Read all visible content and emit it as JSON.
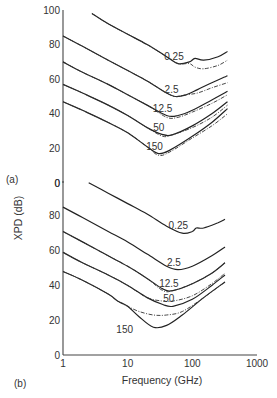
{
  "chart_data": [
    {
      "type": "line",
      "panel_label": "(a)",
      "xscale": "log",
      "xlim": [
        1,
        1000
      ],
      "ylim": [
        0,
        100
      ],
      "yticks": [
        "100",
        "80",
        "60",
        "40",
        "20",
        "0"
      ],
      "ytick_values": [
        100,
        80,
        60,
        40,
        20,
        0
      ],
      "series": [
        {
          "name": "0.25",
          "x": [
            2.8,
            5,
            10,
            20,
            40,
            60,
            90,
            110,
            150,
            250,
            350
          ],
          "y": [
            98,
            92,
            86,
            80,
            73,
            69,
            70,
            72,
            71,
            73,
            76
          ],
          "alt_y": [
            98,
            92,
            86,
            80,
            73,
            69,
            69,
            67,
            66,
            68,
            71
          ]
        },
        {
          "name": "2.5",
          "x": [
            1,
            2,
            5,
            10,
            20,
            40,
            55,
            80,
            120,
            200,
            350
          ],
          "y": [
            85,
            79,
            71,
            65,
            59,
            52,
            50,
            51,
            54,
            58,
            62
          ],
          "alt_y": [
            85,
            79,
            71,
            65,
            59,
            52,
            50,
            51,
            52,
            55,
            58
          ]
        },
        {
          "name": "12.5",
          "x": [
            1,
            2,
            5,
            10,
            20,
            40,
            60,
            100,
            200,
            350
          ],
          "y": [
            70,
            64,
            57,
            51,
            45,
            39,
            39,
            42,
            48,
            53
          ],
          "alt_y": [
            70,
            64,
            57,
            51,
            45,
            38,
            38,
            41,
            46,
            51
          ]
        },
        {
          "name": "50",
          "x": [
            1,
            2,
            5,
            10,
            20,
            35,
            50,
            100,
            200,
            350
          ],
          "y": [
            57,
            52,
            45,
            39,
            32,
            28,
            28,
            33,
            40,
            47
          ],
          "alt_y": [
            57,
            52,
            45,
            39,
            32,
            27,
            28,
            32,
            38,
            45
          ]
        },
        {
          "name": "150",
          "x": [
            1,
            2,
            5,
            10,
            20,
            30,
            45,
            100,
            200,
            350
          ],
          "y": [
            47,
            42,
            35,
            29,
            21,
            17,
            19,
            27,
            35,
            43
          ],
          "alt_y": [
            47,
            42,
            35,
            29,
            21,
            16,
            18,
            26,
            33,
            40
          ]
        }
      ]
    },
    {
      "type": "line",
      "panel_label": "(b)",
      "xscale": "log",
      "xlim": [
        1,
        1000
      ],
      "ylim": [
        0,
        100
      ],
      "yticks": [
        "0",
        "80",
        "60",
        "40",
        "20",
        "0"
      ],
      "ytick_values": [
        100,
        80,
        60,
        40,
        20,
        0
      ],
      "xticks": [
        "1",
        "10",
        "100",
        "1000"
      ],
      "xtick_values": [
        1,
        10,
        100,
        1000
      ],
      "xlabel": "Frequency (GHz)",
      "series": [
        {
          "name": "0.25",
          "x": [
            2.5,
            5,
            10,
            20,
            40,
            70,
            100,
            115,
            150,
            250,
            320
          ],
          "y": [
            99,
            93,
            87,
            81,
            74,
            70,
            71,
            73,
            73,
            76,
            78
          ]
        },
        {
          "name": "2.5",
          "x": [
            1,
            2,
            5,
            10,
            20,
            40,
            60,
            100,
            200,
            320
          ],
          "y": [
            85,
            79,
            71,
            65,
            58,
            51,
            49,
            51,
            57,
            62
          ]
        },
        {
          "name": "12.5",
          "x": [
            1,
            2,
            5,
            10,
            20,
            35,
            50,
            100,
            200,
            320
          ],
          "y": [
            71,
            65,
            57,
            51,
            44,
            38,
            37,
            41,
            47,
            53
          ],
          "alt_y": [
            71,
            65,
            57,
            51,
            44,
            37,
            37,
            41,
            47,
            53
          ]
        },
        {
          "name": "50",
          "x": [
            1,
            2,
            5,
            10,
            20,
            35,
            50,
            100,
            200,
            320
          ],
          "y": [
            59,
            53,
            46,
            40,
            33,
            29,
            28,
            32,
            40,
            46
          ],
          "alt_y": [
            59,
            53,
            46,
            40,
            33,
            31,
            31,
            34,
            41,
            47
          ]
        },
        {
          "name": "150",
          "x": [
            1,
            2,
            5,
            7,
            10,
            15,
            25,
            40,
            70,
            150,
            320
          ],
          "y": [
            48,
            43,
            35,
            31,
            28,
            22,
            16,
            17,
            23,
            33,
            42
          ],
          "alt_y": [
            48,
            43,
            35,
            31,
            28,
            25,
            23,
            23,
            25,
            33,
            42
          ]
        }
      ]
    }
  ],
  "ylabel": "XPD (dB)",
  "panel_labels": {
    "a": "(a)",
    "b": "(b)"
  }
}
